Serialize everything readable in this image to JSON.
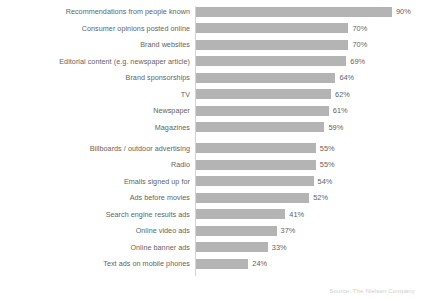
{
  "chart_data": {
    "type": "bar",
    "orientation": "horizontal",
    "title": "",
    "xlabel": "",
    "ylabel": "",
    "xlim": [
      0,
      100
    ],
    "grid": false,
    "legend": null,
    "value_suffix": "%",
    "bar_color": "#b4b4b4",
    "background_color": "#ffffff",
    "categories": [
      "Recommendations from people known",
      "Consumer opinions posted online",
      "Brand websites",
      "Editorial content (e.g. newspaper article)",
      "Brand sponsorships",
      "TV",
      "Newspaper",
      "Magazines",
      "Billboards / outdoor advertising",
      "Radio",
      "Emails signed up for",
      "Ads before movies",
      "Search engine results ads",
      "Online video ads",
      "Online banner ads",
      "Text ads on mobile phones"
    ],
    "values": [
      90,
      70,
      70,
      69,
      64,
      62,
      61,
      59,
      55,
      55,
      54,
      52,
      41,
      37,
      33,
      24
    ],
    "data_labels": [
      "90%",
      "70%",
      "70%",
      "69%",
      "64%",
      "62%",
      "61%",
      "59%",
      "55%",
      "55%",
      "54%",
      "52%",
      "41%",
      "37%",
      "33%",
      "24%"
    ]
  },
  "source_note": "Source: The Nielsen Company"
}
